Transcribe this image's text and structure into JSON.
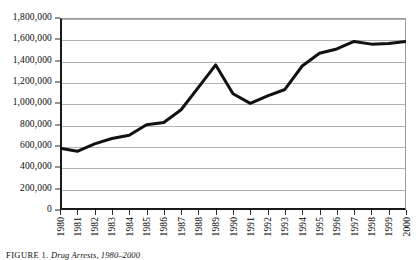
{
  "figure": {
    "caption_label": "FIGURE 1.",
    "caption_title": "Drug Arrests, 1980–2000"
  },
  "chart_data": {
    "type": "line",
    "title": "",
    "xlabel": "",
    "ylabel": "",
    "ylim": [
      0,
      1800000
    ],
    "ytick_step": 200000,
    "grid": true,
    "legend": "none",
    "line_color": "#111111",
    "line_width": 3,
    "categories": [
      "1980",
      "1981",
      "1982",
      "1983",
      "1984",
      "1985",
      "1986",
      "1987",
      "1988",
      "1989",
      "1990",
      "1991",
      "1992",
      "1993",
      "1994",
      "1995",
      "1996",
      "1997",
      "1998",
      "1999",
      "2000"
    ],
    "values": [
      580000,
      550000,
      620000,
      670000,
      700000,
      800000,
      820000,
      940000,
      1150000,
      1360000,
      1090000,
      1000000,
      1070000,
      1130000,
      1350000,
      1470000,
      1510000,
      1580000,
      1555000,
      1560000,
      1580000
    ],
    "ytick_labels": [
      "0",
      "200,000",
      "400,000",
      "600,000",
      "800,000",
      "1,000,000",
      "1,200,000",
      "1,400,000",
      "1,600,000",
      "1,800,000"
    ],
    "ytick_values": [
      0,
      200000,
      400000,
      600000,
      800000,
      1000000,
      1200000,
      1400000,
      1600000,
      1800000
    ]
  }
}
